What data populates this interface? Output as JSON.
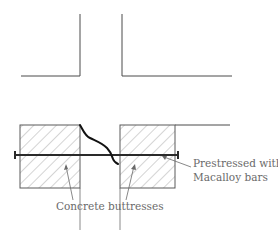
{
  "diagram": {
    "labels": {
      "buttresses": "Concrete buttresses",
      "bars_line1": "Prestressed with",
      "bars_line2": "Macalloy bars"
    },
    "colors": {
      "line": "#4a4a4a",
      "hatch": "#a0a0a0",
      "crack": "#111111",
      "text": "#6a6a6a"
    }
  }
}
